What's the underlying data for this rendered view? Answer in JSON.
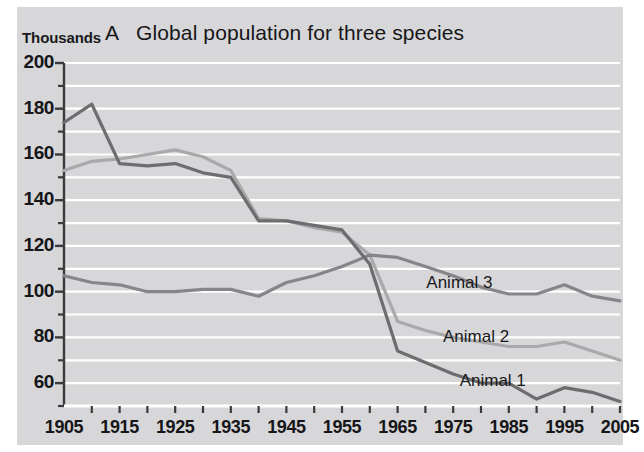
{
  "chart_data": {
    "type": "line",
    "title_letter": "A",
    "title_text": "Global population for three species",
    "xlabel": "",
    "ylabel": "Thousands",
    "y_unit_label": "Thousands",
    "xlim": [
      1905,
      2005
    ],
    "ylim": [
      50,
      200
    ],
    "yticks": [
      60,
      80,
      100,
      120,
      140,
      160,
      180,
      200
    ],
    "ytick_labels": [
      "60",
      "80",
      "100",
      "120",
      "140",
      "160",
      "180",
      "200"
    ],
    "y_minor_ticks": [
      50,
      70,
      90,
      110,
      130,
      150,
      170,
      190
    ],
    "xticks": [
      1905,
      1915,
      1925,
      1935,
      1945,
      1955,
      1965,
      1975,
      1985,
      1995,
      2005
    ],
    "xtick_labels": [
      "1905",
      "1915",
      "1925",
      "1935",
      "1945",
      "1955",
      "1965",
      "1975",
      "1985",
      "1995",
      "2005"
    ],
    "x_minor_ticks": [
      1910,
      1920,
      1930,
      1940,
      1950,
      1960,
      1970,
      1980,
      1990,
      2000
    ],
    "grid": "horizontal",
    "grid_color": "#ffffff",
    "background_color": "#d7d7d9",
    "legend_position": "inline-right",
    "x": [
      1905,
      1910,
      1915,
      1920,
      1925,
      1930,
      1935,
      1940,
      1945,
      1950,
      1955,
      1960,
      1965,
      1970,
      1975,
      1980,
      1985,
      1990,
      1995,
      2000,
      2005
    ],
    "series": [
      {
        "name": "Animal 1",
        "color": "#6d6d70",
        "label": "Animal 1",
        "values": [
          174,
          182,
          156,
          155,
          156,
          152,
          150,
          131,
          131,
          129,
          127,
          112,
          74,
          69,
          64,
          60,
          60,
          53,
          58,
          56,
          52
        ]
      },
      {
        "name": "Animal 2",
        "color": "#a9a9ab",
        "label": "Animal 2",
        "values": [
          153,
          157,
          158,
          160,
          162,
          159,
          153,
          132,
          131,
          128,
          126,
          116,
          87,
          83,
          80,
          78,
          76,
          76,
          78,
          74,
          70
        ]
      },
      {
        "name": "Animal 3",
        "color": "#86868a",
        "label": "Animal 3",
        "values": [
          107,
          104,
          103,
          100,
          100,
          101,
          101,
          98,
          104,
          107,
          111,
          116,
          115,
          111,
          107,
          102,
          99,
          99,
          103,
          98,
          96
        ]
      }
    ],
    "annotations": [
      {
        "text": "Animal 3",
        "x": 1977,
        "y": 104
      },
      {
        "text": "Animal 2",
        "x": 1980,
        "y": 80
      },
      {
        "text": "Animal 1",
        "x": 1983,
        "y": 61
      }
    ]
  }
}
